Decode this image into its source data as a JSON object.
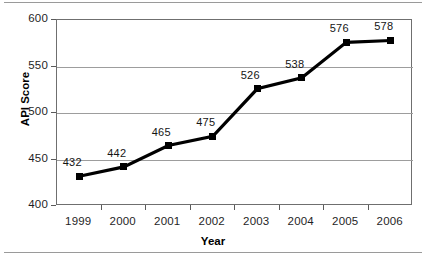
{
  "chart_data": {
    "type": "line",
    "title": "",
    "subtitle": "",
    "xlabel": "Year",
    "ylabel": "API Score",
    "categories": [
      "1999",
      "2000",
      "2001",
      "2002",
      "2003",
      "2004",
      "2005",
      "2006"
    ],
    "values": [
      432,
      442,
      465,
      475,
      526,
      538,
      576,
      578
    ],
    "point_labels": [
      "432",
      "442",
      "465",
      "475",
      "526",
      "538",
      "576",
      "578"
    ],
    "ylim": [
      400,
      600
    ],
    "yticks": [
      400,
      450,
      500,
      550,
      600
    ],
    "ytick_labels": [
      "400",
      "450",
      "500",
      "550",
      "600"
    ],
    "xlim_categories": 8,
    "grid": "horizontal",
    "legend": "none",
    "series": [
      {
        "name": "API Score",
        "values": [
          432,
          442,
          465,
          475,
          526,
          538,
          576,
          578
        ],
        "color": "#000000",
        "marker": "square"
      }
    ],
    "colors": {
      "line": "#000000",
      "marker": "#000000",
      "grid": "#9d9d9d",
      "frame": "#6f6f6f",
      "text": "#1f1f1f",
      "background": "#ffffff"
    }
  }
}
